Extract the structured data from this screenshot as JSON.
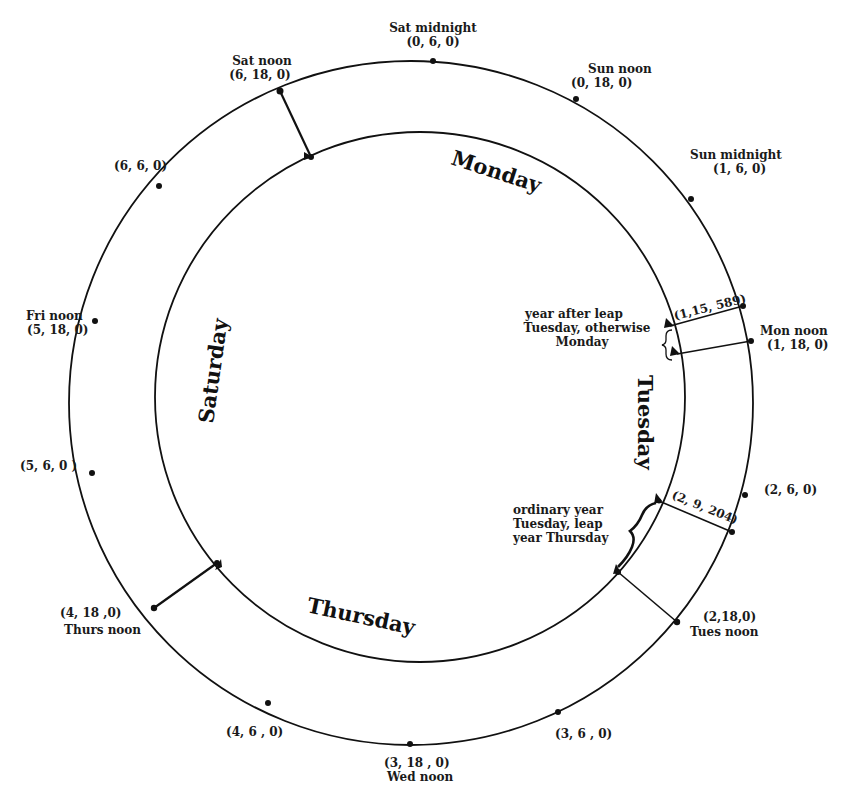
{
  "diagram": {
    "title": "",
    "outer_ring": {
      "cx": 411,
      "cy": 403,
      "r": 342
    },
    "inner_ring": {
      "cx": 420,
      "cy": 397,
      "r": 265
    },
    "day_labels": {
      "monday": "Monday",
      "tuesday": "Tuesday",
      "thursday": "Thursday",
      "saturday": "Saturday"
    },
    "outer_points": [
      {
        "id": "sat-midnight",
        "name": "Sat midnight",
        "coord": "(0, 6, 0)"
      },
      {
        "id": "sun-noon",
        "name": "Sun noon",
        "coord": "(0, 18, 0)"
      },
      {
        "id": "sun-midnight",
        "name": "Sun midnight",
        "coord": "(1, 6, 0)"
      },
      {
        "id": "molad-1-15-589",
        "name": "",
        "coord": "(1,15, 589)"
      },
      {
        "id": "mon-noon",
        "name": "Mon noon",
        "coord": "(1, 18, 0)"
      },
      {
        "id": "mon-midnight",
        "name": "",
        "coord": "(2, 6, 0)"
      },
      {
        "id": "molad-2-9-204",
        "name": "",
        "coord": "(2, 9, 204)"
      },
      {
        "id": "tues-noon",
        "name": "Tues  noon",
        "coord": "(2,18,0)"
      },
      {
        "id": "tues-midnight",
        "name": "",
        "coord": "(3, 6 , 0)"
      },
      {
        "id": "wed-noon",
        "name": "Wed  noon",
        "coord": "(3, 18 , 0)"
      },
      {
        "id": "wed-midnight",
        "name": "",
        "coord": "(4, 6 , 0)"
      },
      {
        "id": "thurs-noon",
        "name": "Thurs  noon",
        "coord": "(4, 18 ,0)"
      },
      {
        "id": "thurs-midnight",
        "name": "",
        "coord": "(5, 6, 0 )"
      },
      {
        "id": "fri-noon",
        "name": "Fri noon",
        "coord": "(5, 18, 0)"
      },
      {
        "id": "fri-midnight",
        "name": "",
        "coord": "(6, 6, 0)"
      },
      {
        "id": "sat-noon",
        "name": "Sat noon",
        "coord": "(6, 18, 0)"
      }
    ],
    "annotations": {
      "year_after_leap": [
        "year after leap",
        "Tuesday, otherwise",
        "Monday"
      ],
      "ordinary_year": [
        "ordinary year",
        "Tuesday, leap",
        "year Thursday"
      ]
    }
  }
}
